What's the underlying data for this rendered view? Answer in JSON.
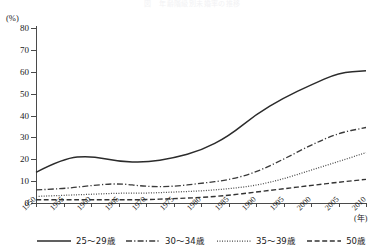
{
  "figure": {
    "faint_top_text": "図　年齢階級別未婚率の推移",
    "y_unit_label": "(%)",
    "x_unit_label": "(年)"
  },
  "chart_data": {
    "type": "line",
    "title": "",
    "xlabel": "(年)",
    "ylabel": "(%)",
    "ylim": [
      0,
      80
    ],
    "xlim": [
      1950,
      2010
    ],
    "yticks": [
      0,
      10,
      20,
      30,
      40,
      50,
      60,
      70,
      80
    ],
    "ytick_labels": [
      "0",
      "10",
      "20",
      "30",
      "40",
      "50",
      "60",
      "70",
      "80"
    ],
    "grid": false,
    "legend_position": "bottom",
    "x": [
      1950,
      1955,
      1960,
      1965,
      1970,
      1975,
      1980,
      1985,
      1990,
      1995,
      2000,
      2005,
      2010
    ],
    "xtick_labels": [
      "1950",
      "1955",
      "1960",
      "1965",
      "1970",
      "1975",
      "1980",
      "1985",
      "1990",
      "1995",
      "2000",
      "2005",
      "2010"
    ],
    "series": [
      {
        "name": "25〜29歳",
        "style": "solid",
        "color": "#2b2b2b",
        "values": [
          14.0,
          20.5,
          21.5,
          19.0,
          18.5,
          20.5,
          24.0,
          30.5,
          40.5,
          48.0,
          54.0,
          59.5,
          60.5
        ]
      },
      {
        "name": "30〜34歳",
        "style": "dash-dot",
        "color": "#3a3a3a",
        "values": [
          6.0,
          6.5,
          8.0,
          9.0,
          7.5,
          7.5,
          9.0,
          10.5,
          14.0,
          20.0,
          26.5,
          32.0,
          34.5
        ]
      },
      {
        "name": "35〜39歳",
        "style": "dotted",
        "color": "#4a4a4a",
        "values": [
          3.0,
          3.5,
          4.0,
          4.5,
          4.5,
          5.0,
          5.5,
          6.5,
          8.0,
          11.0,
          15.0,
          19.0,
          23.0
        ]
      },
      {
        "name": "50歳",
        "style": "dashed",
        "color": "#333333",
        "values": [
          1.5,
          1.5,
          1.5,
          1.5,
          1.5,
          2.0,
          2.5,
          3.5,
          5.0,
          6.5,
          8.0,
          9.5,
          10.8
        ]
      }
    ]
  },
  "legend": {
    "items": [
      {
        "label": "25〜29歳"
      },
      {
        "label": "30〜34歳"
      },
      {
        "label": "35〜39歳"
      },
      {
        "label": "50歳"
      }
    ]
  }
}
